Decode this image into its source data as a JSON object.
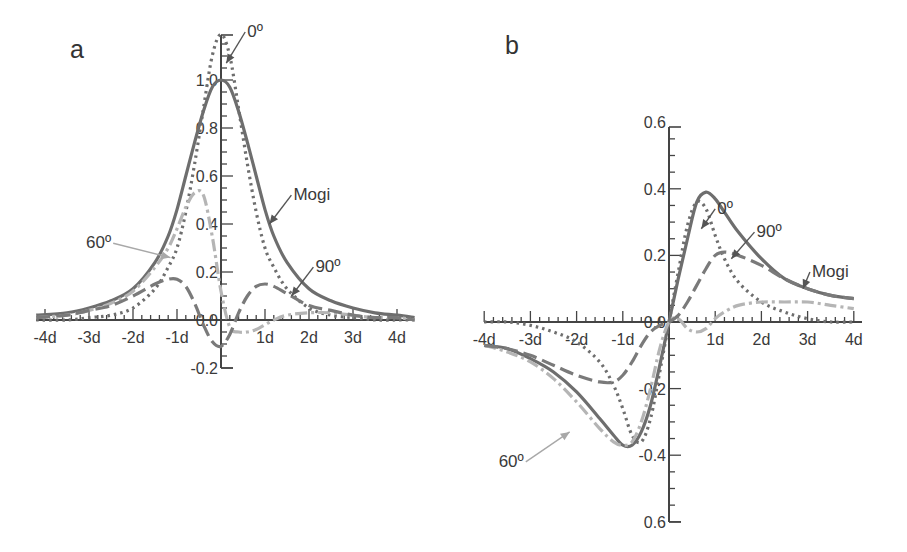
{
  "chart_data": [
    {
      "panel": "a",
      "type": "line",
      "title": "",
      "xlabel": "",
      "ylabel": "",
      "xlim": [
        -4.2,
        4.4
      ],
      "ylim": [
        -0.2,
        1.19
      ],
      "x_tick_labels": [
        "-4d",
        "-3d",
        "-2d",
        "-1d",
        "1d",
        "2d",
        "3d",
        "4d"
      ],
      "x_ticks": [
        -4,
        -3,
        -2,
        -1,
        1,
        2,
        3,
        4
      ],
      "y_tick_labels": [
        "-0.2",
        "0.0",
        "0.2",
        "0.4",
        "0.6",
        "0.8",
        "1.0"
      ],
      "y_ticks": [
        -0.2,
        0.0,
        0.2,
        0.4,
        0.6,
        0.8,
        1.0
      ],
      "grid": false,
      "legend": "inline annotations with arrows",
      "x": [
        -4.2,
        -3.5,
        -3,
        -2.5,
        -2,
        -1.5,
        -1.2,
        -1,
        -0.8,
        -0.6,
        -0.4,
        -0.2,
        0,
        0.2,
        0.4,
        0.6,
        0.8,
        1,
        1.2,
        1.5,
        2,
        2.5,
        3,
        3.5,
        4,
        4.4
      ],
      "series": [
        {
          "name": "Mogi",
          "style": "solid",
          "color": "#6e6e6e",
          "values": [
            0.02,
            0.03,
            0.05,
            0.08,
            0.13,
            0.24,
            0.35,
            0.46,
            0.6,
            0.74,
            0.87,
            0.97,
            1.0,
            0.97,
            0.87,
            0.74,
            0.6,
            0.46,
            0.35,
            0.24,
            0.13,
            0.08,
            0.05,
            0.03,
            0.02,
            0.01
          ]
        },
        {
          "name": "0º",
          "style": "dotted",
          "color": "#6e6e6e",
          "values": [
            0.0,
            0.0,
            0.01,
            0.02,
            0.05,
            0.13,
            0.22,
            0.3,
            0.45,
            0.65,
            0.88,
            1.1,
            1.19,
            1.1,
            0.88,
            0.65,
            0.45,
            0.3,
            0.22,
            0.13,
            0.05,
            0.02,
            0.01,
            0.0,
            0.0,
            0.0
          ]
        },
        {
          "name": "60º",
          "style": "dash-dot",
          "color": "#b5b5b5",
          "values": [
            0.01,
            0.02,
            0.04,
            0.07,
            0.12,
            0.22,
            0.3,
            0.38,
            0.47,
            0.53,
            0.52,
            0.35,
            0.12,
            -0.03,
            -0.05,
            -0.05,
            -0.04,
            -0.02,
            0.0,
            0.02,
            0.03,
            0.03,
            0.02,
            0.01,
            0.01,
            0.0
          ]
        },
        {
          "name": "90º",
          "style": "dashed",
          "color": "#7a7a7a",
          "values": [
            0.01,
            0.02,
            0.04,
            0.06,
            0.1,
            0.15,
            0.17,
            0.17,
            0.14,
            0.07,
            -0.02,
            -0.09,
            -0.11,
            -0.06,
            0.03,
            0.1,
            0.14,
            0.15,
            0.14,
            0.11,
            0.06,
            0.04,
            0.02,
            0.01,
            0.01,
            0.0
          ]
        }
      ],
      "annotations": [
        {
          "text": "0º",
          "at": [
            0.55,
            1.2
          ],
          "arrow_to": [
            0.12,
            1.07
          ]
        },
        {
          "text": "Mogi",
          "at": [
            1.6,
            0.52
          ],
          "arrow_to": [
            1.1,
            0.4
          ]
        },
        {
          "text": "60º",
          "at": [
            -2.45,
            0.32
          ],
          "arrow_to": [
            -1.15,
            0.26
          ]
        },
        {
          "text": "90º",
          "at": [
            2.1,
            0.22
          ],
          "arrow_to": [
            1.6,
            0.1
          ]
        }
      ]
    },
    {
      "panel": "b",
      "type": "line",
      "title": "",
      "xlabel": "",
      "ylabel": "",
      "xlim": [
        -4,
        4
      ],
      "ylim": [
        -0.6,
        0.6
      ],
      "x_tick_labels": [
        "-4d",
        "-3d",
        "-2d",
        "-1d",
        "1d",
        "2d",
        "3d",
        "4d"
      ],
      "x_ticks": [
        -4,
        -3,
        -2,
        -1,
        1,
        2,
        3,
        4
      ],
      "y_tick_labels": [
        "0.6",
        "-0.4",
        "-0.2",
        "0.0",
        "0.2",
        "0.4",
        "0.6"
      ],
      "y_ticks": [
        -0.6,
        -0.4,
        -0.2,
        0.0,
        0.2,
        0.4,
        0.6
      ],
      "grid": false,
      "legend": "inline annotations with arrows",
      "x": [
        -4,
        -3.5,
        -3,
        -2.5,
        -2,
        -1.5,
        -1.2,
        -1,
        -0.8,
        -0.6,
        -0.4,
        -0.2,
        0,
        0.2,
        0.4,
        0.6,
        0.8,
        1,
        1.2,
        1.5,
        2,
        2.5,
        3,
        3.5,
        4
      ],
      "series": [
        {
          "name": "Mogi",
          "style": "solid",
          "color": "#6e6e6e",
          "values": [
            -0.07,
            -0.08,
            -0.11,
            -0.15,
            -0.21,
            -0.29,
            -0.34,
            -0.37,
            -0.37,
            -0.33,
            -0.25,
            -0.13,
            0.0,
            0.13,
            0.25,
            0.36,
            0.39,
            0.37,
            0.33,
            0.27,
            0.19,
            0.13,
            0.1,
            0.08,
            0.07
          ]
        },
        {
          "name": "0º",
          "style": "dotted",
          "color": "#6e6e6e",
          "values": [
            0.0,
            0.0,
            -0.01,
            -0.03,
            -0.06,
            -0.12,
            -0.19,
            -0.26,
            -0.34,
            -0.36,
            -0.29,
            -0.15,
            0.0,
            0.15,
            0.29,
            0.36,
            0.34,
            0.26,
            0.19,
            0.12,
            0.06,
            0.03,
            0.01,
            0.0,
            0.0
          ]
        },
        {
          "name": "60º",
          "style": "dash-dot",
          "color": "#b5b5b5",
          "values": [
            -0.07,
            -0.09,
            -0.12,
            -0.17,
            -0.24,
            -0.32,
            -0.36,
            -0.37,
            -0.36,
            -0.3,
            -0.2,
            -0.08,
            0.0,
            0.01,
            -0.02,
            -0.03,
            -0.02,
            0.01,
            0.03,
            0.05,
            0.06,
            0.06,
            0.06,
            0.05,
            0.04
          ]
        },
        {
          "name": "90º",
          "style": "dashed",
          "color": "#7a7a7a",
          "values": [
            -0.07,
            -0.08,
            -0.1,
            -0.13,
            -0.16,
            -0.18,
            -0.18,
            -0.16,
            -0.12,
            -0.07,
            -0.03,
            -0.01,
            0.0,
            0.02,
            0.06,
            0.11,
            0.16,
            0.2,
            0.21,
            0.2,
            0.17,
            0.13,
            0.1,
            0.08,
            0.07
          ]
        }
      ],
      "annotations": [
        {
          "text": "0º",
          "at": [
            1.0,
            0.34
          ],
          "arrow_to": [
            0.7,
            0.28
          ]
        },
        {
          "text": "90º",
          "at": [
            1.85,
            0.27
          ],
          "arrow_to": [
            1.35,
            0.19
          ]
        },
        {
          "text": "Mogi",
          "at": [
            3.05,
            0.15
          ],
          "arrow_to": [
            2.9,
            0.1
          ]
        },
        {
          "text": "60º",
          "at": [
            -3.1,
            -0.42
          ],
          "arrow_to": [
            -2.15,
            -0.33
          ]
        }
      ]
    }
  ],
  "panels": {
    "a": {
      "label": "a"
    },
    "b": {
      "label": "b"
    }
  }
}
